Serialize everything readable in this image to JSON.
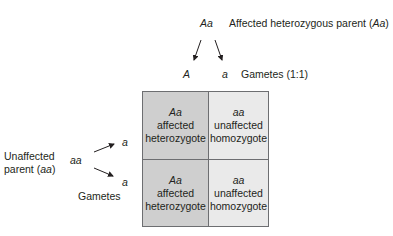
{
  "colors": {
    "dark_cell": "#cfcfcf",
    "light_cell": "#eaeaea",
    "border": "#6d6e71",
    "text": "#231f20"
  },
  "top_parent": {
    "genotype": "Aa",
    "label_prefix": "Affected heterozygous parent (",
    "label_genotype": "Aa",
    "label_suffix": ")"
  },
  "top_gametes": {
    "allele_1": "A",
    "allele_2": "a",
    "label": "Gametes (1:1)"
  },
  "left_parent": {
    "label_line1": "Unaffected",
    "label_line2_prefix": "parent (",
    "label_line2_genotype": "aa",
    "label_line2_suffix": ")",
    "genotype": "aa",
    "gamete_1": "a",
    "gamete_2": "a",
    "gametes_label": "Gametes"
  },
  "punnett": {
    "cells": [
      {
        "genotype": "Aa",
        "line1": "affected",
        "line2": "heterozygote"
      },
      {
        "genotype": "aa",
        "line1": "unaffected",
        "line2": "homozygote"
      },
      {
        "genotype": "Aa",
        "line1": "affected",
        "line2": "heterozygote"
      },
      {
        "genotype": "aa",
        "line1": "unaffected",
        "line2": "homozygote"
      }
    ]
  }
}
